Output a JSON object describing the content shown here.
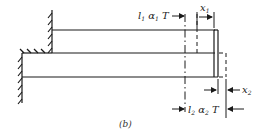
{
  "figure": {
    "caption": "(b)",
    "labels": {
      "upper_elongation": {
        "base": "l",
        "sub1": "1",
        "mid": " α",
        "sub2": "1",
        "tail": " T"
      },
      "lower_elongation": {
        "base": "l",
        "sub1": "2",
        "mid": " α",
        "sub2": "2",
        "tail": " T"
      },
      "x1": {
        "base": "x",
        "sub": "1"
      },
      "x2": {
        "base": "x",
        "sub": "2"
      }
    },
    "colors": {
      "line": "#1a1a1a",
      "background": "#ffffff"
    }
  }
}
